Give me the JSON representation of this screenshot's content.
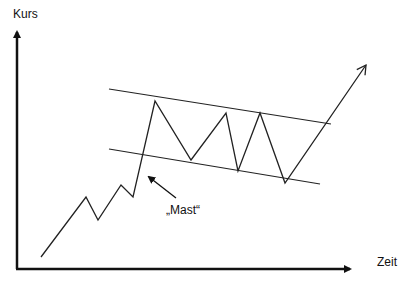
{
  "diagram": {
    "type": "flag-pattern",
    "axes": {
      "y_label": "Kurs",
      "x_label": "Zeit"
    },
    "annotation": {
      "label": "„Mast“"
    },
    "colors": {
      "line": "#222222",
      "axis": "#111111",
      "background": "#ffffff"
    },
    "price_path": [
      [
        41,
        257
      ],
      [
        86,
        197
      ],
      [
        98,
        220
      ],
      [
        121,
        185
      ],
      [
        133,
        197
      ],
      [
        155,
        101
      ],
      [
        191,
        160
      ],
      [
        226,
        113
      ],
      [
        238,
        171
      ],
      [
        260,
        113
      ],
      [
        285,
        183
      ],
      [
        366,
        65
      ]
    ],
    "channel": {
      "upper": [
        [
          109,
          89
        ],
        [
          331,
          124
        ]
      ],
      "lower": [
        [
          109,
          149
        ],
        [
          320,
          184
        ]
      ]
    }
  }
}
